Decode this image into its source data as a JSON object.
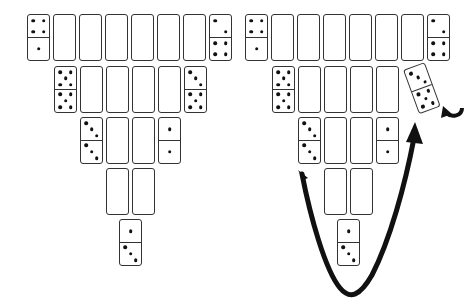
{
  "figure": {
    "ink_color": "#111111",
    "background": "#ffffff"
  },
  "layout": {
    "domino_w": 23,
    "domino_h": 47,
    "rows": [
      {
        "y": 14,
        "x0": 27,
        "count": 8
      },
      {
        "y": 66,
        "x0": 54,
        "count": 6
      },
      {
        "y": 117,
        "x0": 80,
        "count": 4
      },
      {
        "y": 168,
        "x0": 106,
        "count": 2
      },
      {
        "y": 219,
        "x0": 119,
        "count": 1
      }
    ],
    "step": 26
  },
  "panels": [
    {
      "name": "before",
      "offset_x": 0,
      "rows": [
        [
          [
            4,
            1
          ],
          [
            null,
            null
          ],
          [
            null,
            null
          ],
          [
            null,
            null
          ],
          [
            null,
            null
          ],
          [
            null,
            null
          ],
          [
            null,
            null
          ],
          [
            2,
            4
          ]
        ],
        [
          [
            5,
            5
          ],
          [
            null,
            null
          ],
          [
            null,
            null
          ],
          [
            null,
            null
          ],
          [
            null,
            null
          ],
          [
            3,
            5
          ]
        ],
        [
          [
            3,
            3
          ],
          [
            null,
            null
          ],
          [
            null,
            null
          ],
          [
            1,
            1
          ]
        ],
        [
          [
            null,
            null
          ],
          [
            null,
            null
          ]
        ],
        [
          [
            1,
            3
          ]
        ]
      ],
      "moved_tile": null
    },
    {
      "name": "after",
      "offset_x": 218,
      "rows": [
        [
          [
            4,
            1
          ],
          [
            null,
            null
          ],
          [
            null,
            null
          ],
          [
            null,
            null
          ],
          [
            null,
            null
          ],
          [
            null,
            null
          ],
          [
            null,
            null
          ],
          [
            2,
            4
          ]
        ],
        [
          [
            5,
            5
          ],
          [
            null,
            null
          ],
          [
            null,
            null
          ],
          [
            null,
            null
          ],
          [
            null,
            null
          ],
          "removed"
        ],
        [
          [
            3,
            3
          ],
          [
            null,
            null
          ],
          [
            null,
            null
          ],
          [
            1,
            1
          ]
        ],
        [
          [
            null,
            null
          ],
          [
            null,
            null
          ]
        ],
        [
          [
            1,
            3
          ]
        ]
      ],
      "moved_tile": {
        "values": [
          3,
          5
        ],
        "x": 403,
        "y": 70,
        "rotation_deg": -20
      },
      "arrows": [
        {
          "name": "u-turn-arrow",
          "path": "from row3 left tile down around row5 up to moved tile"
        },
        {
          "name": "curl-arrow",
          "position": "right of moved tile"
        }
      ]
    }
  ]
}
